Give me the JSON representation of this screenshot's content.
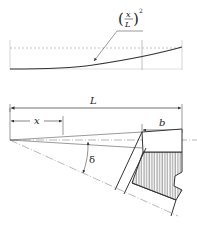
{
  "diagram": {
    "top_graph": {
      "curve_label_base": "x",
      "curve_label_den": "L",
      "curve_label_exp": "2"
    },
    "dimensions": {
      "L_label": "L",
      "x_label": "x",
      "b_label": "b",
      "delta_label": "δ"
    }
  },
  "colors": {
    "line": "#333333",
    "thin": "#555555",
    "dashed": "#999999",
    "hatch": "#444444",
    "background": "#ffffff"
  }
}
